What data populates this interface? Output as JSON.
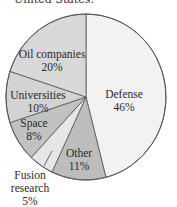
{
  "caption": "United States.",
  "chart_data": {
    "type": "pie",
    "title": "",
    "start_angle_deg": 0,
    "direction": "clockwise",
    "slices": [
      {
        "label": "Defense",
        "value": 46,
        "display": "46%",
        "color": "#f2f2f2"
      },
      {
        "label": "Other",
        "value": 11,
        "display": "11%",
        "color": "#bdbdbd"
      },
      {
        "label": "Fusion research",
        "value": 5,
        "display": "5%",
        "color": "#e6e6e6"
      },
      {
        "label": "Space",
        "value": 8,
        "display": "8%",
        "color": "#c2c2c2"
      },
      {
        "label": "Universities",
        "value": 10,
        "display": "10%",
        "color": "#d3d3d3"
      },
      {
        "label": "Oil companies",
        "value": 20,
        "display": "20%",
        "color": "#d8d8d8"
      }
    ]
  },
  "labels": {
    "defense": {
      "name": "Defense",
      "pct": "46%"
    },
    "other": {
      "name": "Other",
      "pct": "11%"
    },
    "fusion": {
      "name1": "Fusion",
      "name2": "research",
      "pct": "5%"
    },
    "space": {
      "name": "Space",
      "pct": "8%"
    },
    "universities": {
      "name": "Universities",
      "pct": "10%"
    },
    "oil": {
      "name": "Oil companies",
      "pct": "20%"
    }
  }
}
